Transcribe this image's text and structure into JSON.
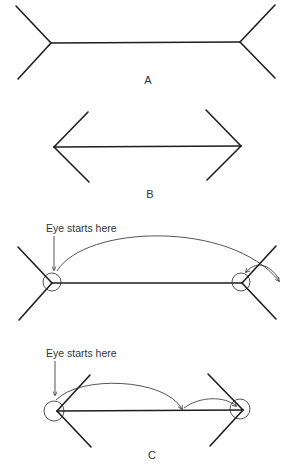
{
  "figures": {
    "a": {
      "label": "A"
    },
    "b": {
      "label": "B"
    },
    "c_top": {
      "annotation": "Eye starts here"
    },
    "c_bottom": {
      "annotation": "Eye starts here"
    },
    "c": {
      "label": "C"
    }
  },
  "colors": {
    "ink": "#1e1e1e",
    "background": "#ffffff"
  }
}
